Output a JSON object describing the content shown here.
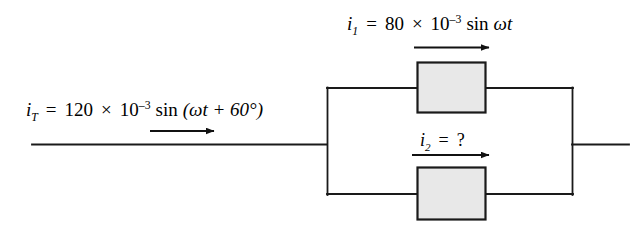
{
  "figure": {
    "background_color": "#ffffff",
    "wire_color": "#1a1a1a",
    "box_fill_color": "#e8e8e8",
    "box_stroke_color": "#1a1a1a"
  },
  "labels": {
    "total_current": {
      "symbol": "i",
      "subscript": "T",
      "equals": "=",
      "magnitude": "120",
      "times": "×",
      "base": "10",
      "exponent": "–3",
      "function": "sin",
      "argument": "(ωt + 60°)",
      "full_text": "i_T = 120 × 10⁻³ sin (ωt + 60°)"
    },
    "branch1_current": {
      "symbol": "i",
      "subscript": "1",
      "equals": "=",
      "magnitude": "80",
      "times": "×",
      "base": "10",
      "exponent": "–3",
      "function": "sin",
      "argument": "ωt",
      "full_text": "i_1 = 80 × 10⁻³ sin ωt"
    },
    "branch2_current": {
      "symbol": "i",
      "subscript": "2",
      "equals": "=",
      "value": "?",
      "full_text": "i_2 = ?"
    }
  },
  "components": {
    "top_block": {
      "name": "impedance-block-1",
      "label": ""
    },
    "bottom_block": {
      "name": "impedance-block-2",
      "label": ""
    }
  },
  "arrows": {
    "total_current_arrow": {
      "direction": "right"
    },
    "branch1_current_arrow": {
      "direction": "right"
    },
    "branch2_current_arrow": {
      "direction": "right"
    }
  }
}
